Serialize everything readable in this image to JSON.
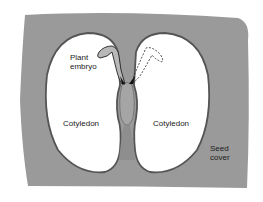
{
  "diagram": {
    "colors": {
      "seed_cover": "#9a9a9a",
      "seed_cover_dark": "#6e6e6e",
      "cotyledon_fill": "#ffffff",
      "embryo_fill": "#b8b8b8",
      "outline": "#222222"
    },
    "labels": {
      "plant_embryo_line1": "Plant",
      "plant_embryo_line2": "embryo",
      "cotyledon_left": "Cotyledon",
      "cotyledon_right": "Cotyledon",
      "seed_cover_line1": "Seed",
      "seed_cover_line2": "cover"
    }
  }
}
